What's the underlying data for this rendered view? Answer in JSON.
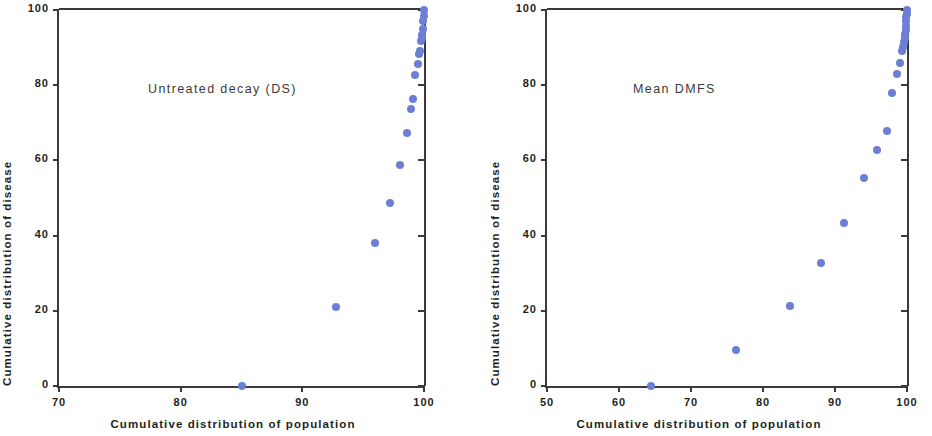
{
  "figure": {
    "marker_color": "#6c7fd4",
    "axis_color": "#3b3a38",
    "background": "#ffffff"
  },
  "chart_data": [
    {
      "type": "scatter",
      "title": "Untreated decay (DS)",
      "xlabel": "Cumulative distribution of population",
      "ylabel": "Cumulative distribution of disease",
      "xlim": [
        70,
        100
      ],
      "ylim": [
        0,
        100
      ],
      "xticks": [
        70,
        80,
        90,
        100
      ],
      "yticks": [
        0,
        20,
        40,
        60,
        80,
        100
      ],
      "grid": false,
      "legend": "none",
      "x": [
        85.0,
        92.8,
        96.0,
        97.2,
        98.0,
        98.6,
        98.9,
        99.1,
        99.3,
        99.5,
        99.6,
        99.7,
        99.75,
        99.8,
        99.85,
        99.9,
        99.93,
        99.96,
        100.0
      ],
      "y": [
        0.0,
        20.9,
        38.1,
        48.8,
        58.8,
        67.2,
        73.6,
        76.4,
        82.6,
        85.6,
        88.3,
        89.2,
        91.8,
        92.6,
        93.4,
        95.0,
        97.2,
        98.4,
        100.0
      ]
    },
    {
      "type": "scatter",
      "title": "Mean DMFS",
      "xlabel": "Cumulative distribution of population",
      "ylabel": "Cumulative distribution of disease",
      "xlim": [
        50,
        100
      ],
      "ylim": [
        0,
        100
      ],
      "xticks": [
        50,
        60,
        70,
        80,
        90,
        100
      ],
      "yticks": [
        0,
        20,
        40,
        60,
        80,
        100
      ],
      "grid": false,
      "legend": "none",
      "x": [
        64.5,
        76.3,
        83.7,
        88.0,
        91.2,
        94.0,
        95.8,
        97.2,
        97.9,
        98.6,
        99.0,
        99.3,
        99.5,
        99.6,
        99.7,
        99.75,
        99.8,
        99.85,
        99.9,
        99.93,
        99.96,
        100.0
      ],
      "y": [
        0.0,
        9.6,
        21.4,
        32.7,
        43.4,
        55.2,
        62.8,
        67.9,
        77.9,
        83.0,
        85.9,
        89.0,
        90.2,
        91.4,
        92.5,
        93.6,
        94.6,
        95.8,
        97.0,
        98.1,
        99.0,
        100.0
      ]
    }
  ]
}
